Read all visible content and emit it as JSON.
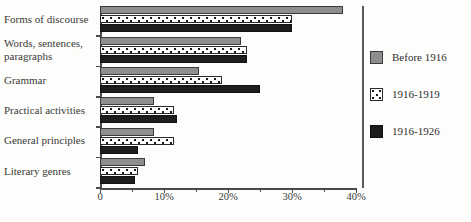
{
  "chart_data": {
    "type": "bar",
    "orientation": "horizontal",
    "title": "",
    "xlabel": "",
    "ylabel": "",
    "grid": false,
    "legend_position": "right",
    "xlim": [
      0,
      40
    ],
    "xtick_labels": [
      "0",
      "10%",
      "20%",
      "30%",
      "40%"
    ],
    "xtick_values": [
      0,
      10,
      20,
      30,
      40
    ],
    "xtick_minor_values": [
      5,
      15,
      25,
      35
    ],
    "categories": [
      "Forms of discourse",
      "Words, sentences,\nparagraphs",
      "Grammar",
      "Practical activities",
      "General principles",
      "Literary genres"
    ],
    "series": [
      {
        "name": "Before 1916",
        "color": "#8e8e8e",
        "pattern": "solid-gray",
        "values": [
          38,
          22,
          15.5,
          8.5,
          8.5,
          7
        ]
      },
      {
        "name": "1916-1919",
        "color": "#ffffff",
        "pattern": "dotted",
        "values": [
          30,
          23,
          19,
          11.5,
          11.5,
          6
        ]
      },
      {
        "name": "1916-1926",
        "color": "#1d1d1d",
        "pattern": "solid-black",
        "values": [
          30,
          23,
          25,
          12,
          6,
          5.5
        ]
      }
    ]
  },
  "legend": {
    "items": [
      {
        "label": "Before 1916",
        "swatch": "solid-gray"
      },
      {
        "label": "1916-1919",
        "swatch": "dotted"
      },
      {
        "label": "1916-1926",
        "swatch": "solid-black"
      }
    ]
  },
  "axis": {
    "x_labels": [
      "0",
      "10%",
      "20%",
      "30%",
      "40%"
    ]
  }
}
